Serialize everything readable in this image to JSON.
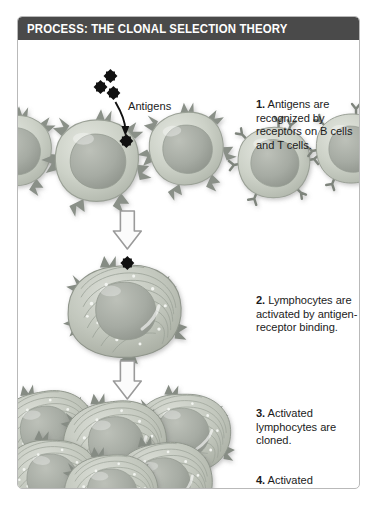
{
  "figure": {
    "title": "PROCESS: THE CLONAL SELECTION THEORY",
    "title_bar_color": "#4a4a4a",
    "border_color": "#b9b9b9",
    "background_color": "#ffffff"
  },
  "labels": {
    "antigens": "Antigens"
  },
  "steps": [
    {
      "number": "1.",
      "text": "Antigens are recognized by receptors on B cells and T cells."
    },
    {
      "number": "2.",
      "text": "Lymphocytes are activated by antigen-receptor binding."
    },
    {
      "number": "3.",
      "text": "Activated lymphocytes are cloned."
    },
    {
      "number": "4.",
      "text": "Activated lymphocytes endure."
    }
  ],
  "illustration": {
    "antigen_color": "#111111",
    "antigen_count_free": 3,
    "antigen_bound_row1": 1,
    "antigen_bound_row2": 1,
    "cell_cytoplasm_color": "#c9cec4",
    "cell_nucleus_color": "#a8aca6",
    "receptor_color": "#8e948c",
    "arrow_outline_color": "#9a9a9a",
    "resting_cell_count": 5,
    "activated_cell_count": 1,
    "cloned_cell_count": 6,
    "flow_arrows": 2
  }
}
